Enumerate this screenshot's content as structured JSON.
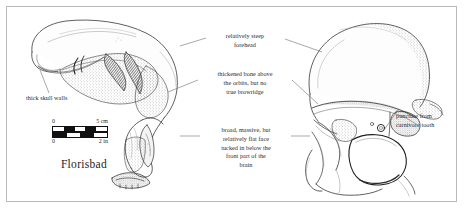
{
  "figure": {
    "caption": "Florisbad",
    "background_color": "#ffffff",
    "frame_color": "#b9b9b9",
    "ink_color": "#2a2a2a"
  },
  "annotations": [
    {
      "id": "thick-skull-walls",
      "text": "thick skull walls",
      "target": "left-skull-anterior-edge"
    },
    {
      "id": "relatively-steep-forehead",
      "text": "relatively steep\nforehead",
      "target": "both-skulls-frontal"
    },
    {
      "id": "thickened-bone-above-orbits",
      "text": "thickened bone above\nthe orbits, but no\ntrue browridge",
      "target": "supraorbital-region"
    },
    {
      "id": "broad-massive-flat-face",
      "text": "broad, massive, but\nrelatively flat face\ntucked in below the\nfront part of the\nbrain",
      "target": "facial-skeleton"
    },
    {
      "id": "puncture-from-carnivore-tooth",
      "text": "puncture from\ncarnivore tooth",
      "target": "right-skull-zygomatic-puncture"
    }
  ],
  "scale_bar": {
    "top_units": "cm",
    "top_min_label": "0",
    "top_max_label": "5 cm",
    "bottom_units": "in",
    "bottom_min_label": "0",
    "bottom_max_label": "2 in",
    "top_segments": [
      "white",
      "black",
      "white",
      "black",
      "white"
    ],
    "bottom_segments": [
      "black",
      "white",
      "black",
      "white"
    ]
  },
  "specimens": [
    {
      "id": "left-skull",
      "view": "lateral / superior oblique",
      "description": "Florisbad cranium shown in oblique lateral view with thick vault walls and broken cross-section hatching"
    },
    {
      "id": "right-skull",
      "view": "anterior / frontal",
      "description": "Florisbad cranium shown in frontal view with orbit, thickened supraorbital bone and carnivore tooth puncture"
    }
  ]
}
